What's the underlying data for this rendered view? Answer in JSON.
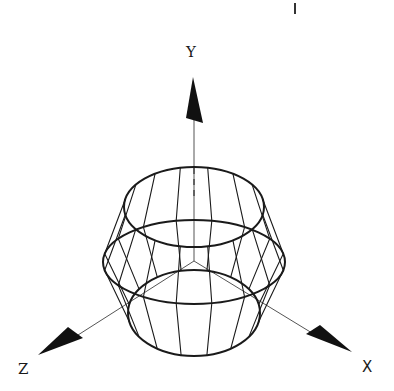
{
  "figure": {
    "type": "3d-wireframe-surface-of-revolution",
    "line_color": "#1a1a1a",
    "background": "#ffffff"
  },
  "axes": {
    "y": {
      "label": "Y"
    },
    "x": {
      "label": "X"
    },
    "z": {
      "label": "Z"
    }
  },
  "shape": {
    "rings": [
      {
        "name": "top",
        "cx": 194,
        "cy": 207,
        "rx": 70,
        "ry": 40
      },
      {
        "name": "middle",
        "cx": 194,
        "cy": 262,
        "rx": 91,
        "ry": 42
      },
      {
        "name": "bottom",
        "cx": 194,
        "cy": 313,
        "rx": 66,
        "ry": 43
      }
    ],
    "meridians": 16
  },
  "marks": {
    "top_tick": "|"
  }
}
